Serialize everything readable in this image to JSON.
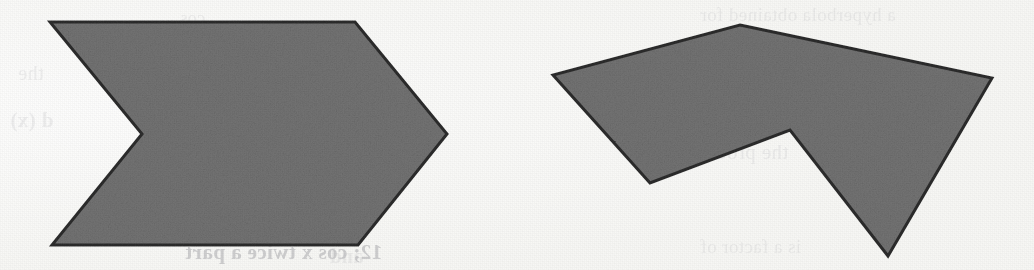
{
  "figure": {
    "kind": "scanned-geometry-figure",
    "background_color": "#fdfdfc",
    "shape_fill_color": "#757575",
    "shape_stroke_color": "#2e2e2e",
    "shape_stroke_width": 3,
    "width": 1034,
    "height": 270,
    "caption": ""
  },
  "shapes": [
    {
      "id": "left-chevron",
      "name": "concave-chevron-polygon",
      "description": "Arrow / chevron shaped hexagon pointing right with a V notch cut into the left side",
      "vertex_count": 6,
      "points": "50,22 355,22 447,134 358,245 52,245 142,134",
      "fill": "#757575",
      "stroke": "#2e2e2e"
    },
    {
      "id": "right-arrow",
      "name": "concave-arrow-polygon",
      "description": "Broad arrowhead shaped hexagon with a downward spike and a reflex notch on the lower middle",
      "vertex_count": 6,
      "points": "740,25 992,78 888,256 790,130 650,183 553,75",
      "fill": "#757575",
      "stroke": "#2e2e2e"
    }
  ],
  "ghost_text": [
    {
      "text": "a hyperbola obtained for",
      "x": 700,
      "y": 4,
      "size": 19,
      "weight": "400",
      "class": "g-faint"
    },
    {
      "text": "the process",
      "x": 690,
      "y": 140,
      "size": 21,
      "weight": "400",
      "class": "g-faint"
    },
    {
      "text": "is a factor of",
      "x": 700,
      "y": 236,
      "size": 19,
      "weight": "400",
      "class": "g-faint"
    },
    {
      "text": "cos",
      "x": 180,
      "y": 8,
      "size": 18,
      "weight": "400",
      "class": "g-faint"
    },
    {
      "text": "the",
      "x": 18,
      "y": 62,
      "size": 20,
      "weight": "400",
      "class": "g-faint"
    },
    {
      "text": "d (x)",
      "x": 10,
      "y": 108,
      "size": 21,
      "weight": "700",
      "class": "g-faint"
    },
    {
      "text": "12; cos x twice a part",
      "x": 185,
      "y": 240,
      "size": 21,
      "weight": "700",
      "class": "g-strong"
    },
    {
      "text": "and",
      "x": 330,
      "y": 245,
      "size": 20,
      "weight": "700",
      "class": "g-faint"
    }
  ]
}
